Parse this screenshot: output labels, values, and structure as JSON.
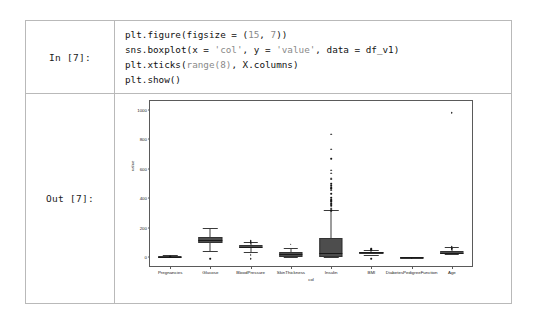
{
  "notebook": {
    "input_prompt": "In [7]:",
    "output_prompt": "Out [7]:",
    "code": {
      "line1_a": "plt.figure(figsize = (",
      "line1_n1": "15",
      "line1_b": ", ",
      "line1_n2": "7",
      "line1_c": "))",
      "line2_a": "sns.boxplot(x = ",
      "line2_s1": "'col'",
      "line2_b": ", y = ",
      "line2_s2": "'value'",
      "line2_c": ", data = df_v1)",
      "line3_a": "plt.xticks(",
      "line3_b": "range(",
      "line3_n": "8",
      "line3_c": ")",
      "line3_d": ", X.columns)",
      "line4": "plt.show()"
    }
  },
  "chart_data": {
    "type": "bar",
    "plot_kind": "boxplot",
    "title": "",
    "xlabel": "col",
    "ylabel": "value",
    "ylim": [
      -60,
      1060
    ],
    "yticks": [
      0,
      200,
      400,
      600,
      800,
      1000
    ],
    "ytick_labels": [
      "0",
      "200",
      "400",
      "600",
      "800",
      "1000"
    ],
    "grid": false,
    "legend": "none",
    "categories": [
      "Pregnancies",
      "Glucose",
      "BloodPressure",
      "SkinThickness",
      "Insulin",
      "BMI",
      "DiabetesPedigreeFunction",
      "Age"
    ],
    "boxes": [
      {
        "name": "Pregnancies",
        "whisker_low": 0,
        "q1": 1,
        "median": 3,
        "q3": 6,
        "whisker_high": 13,
        "fliers": [
          15,
          17
        ]
      },
      {
        "name": "Glucose",
        "whisker_low": 44,
        "q1": 99,
        "median": 117,
        "q3": 140,
        "whisker_high": 199,
        "fliers": [
          0
        ]
      },
      {
        "name": "BloodPressure",
        "whisker_low": 38,
        "q1": 62,
        "median": 72,
        "q3": 80,
        "whisker_high": 106,
        "fliers": [
          0,
          24,
          30,
          110,
          114,
          122
        ]
      },
      {
        "name": "SkinThickness",
        "whisker_low": 0,
        "q1": 0,
        "median": 23,
        "q3": 32,
        "whisker_high": 60,
        "fliers": [
          99
        ]
      },
      {
        "name": "Insulin",
        "whisker_low": 0,
        "q1": 0,
        "median": 30,
        "q3": 127,
        "whisker_high": 318,
        "fliers": [
          325,
          335,
          342,
          360,
          370,
          375,
          387,
          392,
          402,
          415,
          440,
          465,
          474,
          480,
          495,
          510,
          540,
          545,
          579,
          600,
          680,
          744,
          846
        ]
      },
      {
        "name": "BMI",
        "whisker_low": 18,
        "q1": 27,
        "median": 32,
        "q3": 36,
        "whisker_high": 50,
        "fliers": [
          0,
          57,
          59,
          67
        ]
      },
      {
        "name": "DiabetesPedigreeFunction",
        "whisker_low": 0,
        "q1": 0,
        "median": 0,
        "q3": 1,
        "whisker_high": 1,
        "fliers": [
          2
        ]
      },
      {
        "name": "Age",
        "whisker_low": 21,
        "q1": 24,
        "median": 29,
        "q3": 41,
        "whisker_high": 66,
        "fliers": [
          67,
          69,
          72,
          81,
          990
        ]
      }
    ],
    "colors": {
      "box_fill": "#4d4d4d",
      "box_edge": "#333333",
      "median": "#1a1a1a",
      "flier": "#141414",
      "axes_frame": "#5a5a5a"
    }
  }
}
